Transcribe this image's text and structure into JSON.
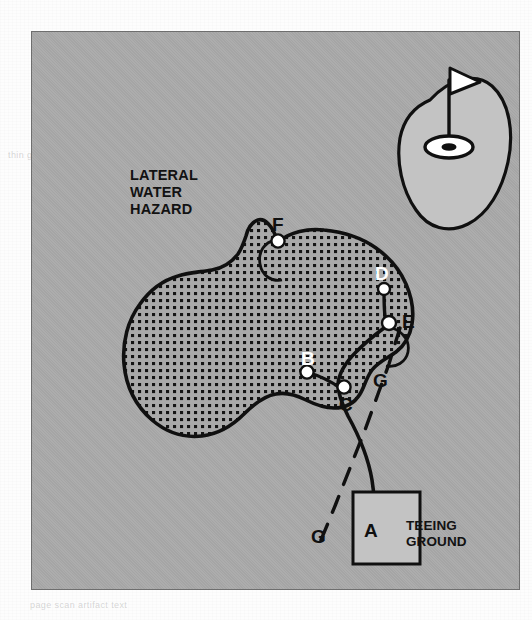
{
  "figure": {
    "background_color": "#a9a9a9",
    "panel_border_color": "#6e6e6e",
    "ink_color": "#101010",
    "green_fill": "#c3c3c3",
    "teeing_ground_fill": "#c3c3c3",
    "hazard_fill": "#a9a9a9",
    "hazard_dot_color": "#141414"
  },
  "annotations": {
    "hazard_name": "LATERAL\nWATER\nHAZARD",
    "teeing_ground_name": "TEEING\nGROUND"
  },
  "points": [
    {
      "id": "A",
      "label": "A",
      "x": 368,
      "y": 528,
      "label_x": 362,
      "label_y": 518,
      "style": "dark",
      "marker": false,
      "description": "ball position on teeing ground"
    },
    {
      "id": "B",
      "label": "B",
      "x": 306,
      "y": 371,
      "label_x": 299,
      "label_y": 348,
      "style": "light",
      "marker": true,
      "description": "point where ball last crossed margin of hazard"
    },
    {
      "id": "C",
      "label": "C",
      "x": 343,
      "y": 386,
      "label_x": 337,
      "label_y": 394,
      "style": "dark",
      "marker": true,
      "description": "point where ball last crossed margin of hazard"
    },
    {
      "id": "D",
      "label": "D",
      "x": 383,
      "y": 288,
      "label_x": 373,
      "label_y": 263,
      "style": "light",
      "marker": true,
      "description": "ball in hazard"
    },
    {
      "id": "E",
      "label": "E",
      "x": 389,
      "y": 322,
      "label_x": 400,
      "label_y": 311,
      "style": "dark",
      "marker": true,
      "description": "point where ball last crossed margin"
    },
    {
      "id": "F",
      "label": "F",
      "x": 277,
      "y": 240,
      "label_x": 270,
      "label_y": 214,
      "style": "light",
      "marker": true,
      "description": "equidistant point on opposite margin"
    },
    {
      "id": "G",
      "label": "G",
      "x": 378,
      "y": 381,
      "label_x": 371,
      "label_y": 370,
      "style": "dark",
      "marker": false,
      "description": "line of flight marker upper"
    },
    {
      "id": "G2",
      "label": "G",
      "x": 316,
      "y": 536,
      "label_x": 310,
      "label_y": 526,
      "style": "dark",
      "marker": false,
      "description": "line of flight marker lower"
    }
  ],
  "paths": {
    "ball_flight_solid": "curved solid line from A through C to E",
    "line_of_flight_dashed": "dashed straight line G to G through E"
  },
  "green": {
    "name": "putting green",
    "flag": "flag-in-hole"
  },
  "ghost_text": {
    "top": "rule relief options for ball in lateral water hazard",
    "bottom_left": "thin ghost line of text showing through paper",
    "bottom_right": "page scan artifact text"
  }
}
